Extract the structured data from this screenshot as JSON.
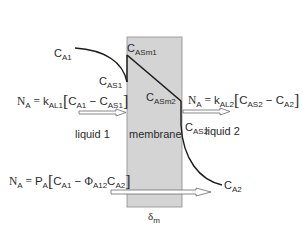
{
  "diagram": {
    "regions": {
      "liquid1": "liquid 1",
      "membrane": "membrane",
      "liquid2": "liquid 2"
    },
    "concentrations": {
      "CA1": {
        "main": "C",
        "sub": "A1"
      },
      "CAS1": {
        "main": "C",
        "sub": "AS1"
      },
      "CASm1": {
        "main": "C",
        "sub": "ASm1"
      },
      "CASm2": {
        "main": "C",
        "sub": "ASm2"
      },
      "CAS2": {
        "main": "C",
        "sub": "AS2"
      },
      "CA2": {
        "main": "C",
        "sub": "A2"
      }
    },
    "thickness": {
      "main": "δ",
      "sub": "m"
    },
    "equations": {
      "liquid1_flux": {
        "lhs": "N",
        "lhs_sub": "A",
        "eq": " = ",
        "coef": "k",
        "coef_sub": "AL1",
        "open": "[",
        "t1": "C",
        "t1_sub": "A1",
        "op": " − ",
        "t2": "C",
        "t2_sub": "AS1",
        "close": "]"
      },
      "liquid2_flux": {
        "lhs": "N",
        "lhs_sub": "A",
        "eq": " = ",
        "coef": "k",
        "coef_sub": "AL2",
        "open": "[",
        "t1": "C",
        "t1_sub": "AS2",
        "op": " − ",
        "t2": "C",
        "t2_sub": "A2",
        "close": "]"
      },
      "overall_flux": {
        "lhs": "N",
        "lhs_sub": "A",
        "eq": " = ",
        "coef": "P",
        "coef_sub": "A",
        "open": "[",
        "t1": "C",
        "t1_sub": "A1",
        "op": " − ",
        "phi": "Φ",
        "phi_sub": "A12",
        "t2": "C",
        "t2_sub": "A2",
        "close": "]"
      }
    },
    "colors": {
      "membrane_fill": "#d4d4d4",
      "membrane_stroke": "#8a8a8a",
      "line": "#1a1a1a",
      "arrow_fill": "#ffffff",
      "arrow_stroke": "#6a6a6a"
    }
  }
}
